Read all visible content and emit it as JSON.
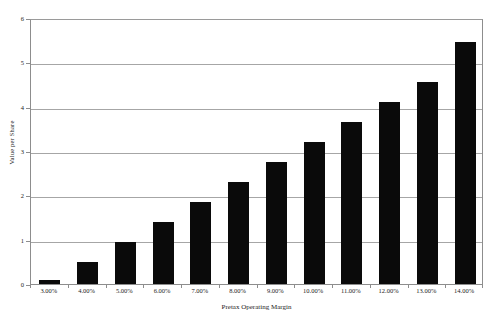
{
  "chart_data": {
    "type": "bar",
    "title": "",
    "xlabel": "Pretax Operating Margin",
    "ylabel": "Value per Share",
    "categories": [
      "3.00%",
      "4.00%",
      "5.00%",
      "6.00%",
      "7.00%",
      "8.00%",
      "9.00%",
      "10.00%",
      "11.00%",
      "12.00%",
      "13.00%",
      "14.00%"
    ],
    "values": [
      0.08,
      0.5,
      0.95,
      1.4,
      1.85,
      2.3,
      2.75,
      3.2,
      3.65,
      4.1,
      4.55,
      5.45
    ],
    "ylim": [
      0,
      6
    ],
    "yticks": [
      0,
      1,
      2,
      3,
      4,
      5,
      6
    ],
    "ytick_labels": [
      "0",
      "1",
      "2",
      "3",
      "4",
      "5",
      "6"
    ],
    "grid": true,
    "legend": false,
    "bar_color": "#0a0a0a",
    "grid_color": "#a6a6a6",
    "frame_color": "#8d8d8d",
    "background": "#ffffff"
  }
}
